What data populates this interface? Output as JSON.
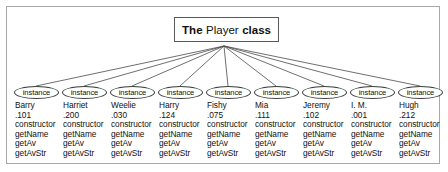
{
  "figure": {
    "title_box": {
      "prefix": "The",
      "class_name": "Player",
      "suffix": "class"
    },
    "instance_label": "instance",
    "instances": [
      {
        "name": "Barry",
        "average": ".101",
        "methods": [
          "constructor",
          "getName",
          "getAv",
          "getAvStr"
        ]
      },
      {
        "name": "Harriet",
        "average": ".200",
        "methods": [
          "constructor",
          "getName",
          "getAv",
          "getAvStr"
        ]
      },
      {
        "name": "Weelie",
        "average": ".030",
        "methods": [
          "constructor",
          "getName",
          "getAv",
          "getAvStr"
        ]
      },
      {
        "name": "Harry",
        "average": ".124",
        "methods": [
          "constructor",
          "getName",
          "getAv",
          "getAvStr"
        ]
      },
      {
        "name": "Fishy",
        "average": ".075",
        "methods": [
          "constructor",
          "getName",
          "getAv",
          "getAvStr"
        ]
      },
      {
        "name": "Mia",
        "average": ".111",
        "methods": [
          "constructor",
          "getName",
          "getAv",
          "getAvStr"
        ]
      },
      {
        "name": "Jeremy",
        "average": ".102",
        "methods": [
          "constructor",
          "getName",
          "getAv",
          "getAvStr"
        ]
      },
      {
        "name": "I. M.",
        "average": ".001",
        "methods": [
          "constructor",
          "getName",
          "getAv",
          "getAvStr"
        ]
      },
      {
        "name": "Hugh",
        "average": ".212",
        "methods": [
          "constructor",
          "getName",
          "getAv",
          "getAvStr"
        ]
      }
    ],
    "colors": {
      "frame_border": "#a8a8a8",
      "box_border": "#5a5a5a",
      "edge_line": "#4a4a4a",
      "text": "#111111",
      "background": "#ffffff"
    },
    "layout": {
      "hub_x": 224,
      "hub_y": 46,
      "column_xs": [
        14,
        62,
        110,
        158,
        206,
        254,
        302,
        350,
        398
      ],
      "ellipse_top": 86
    }
  }
}
